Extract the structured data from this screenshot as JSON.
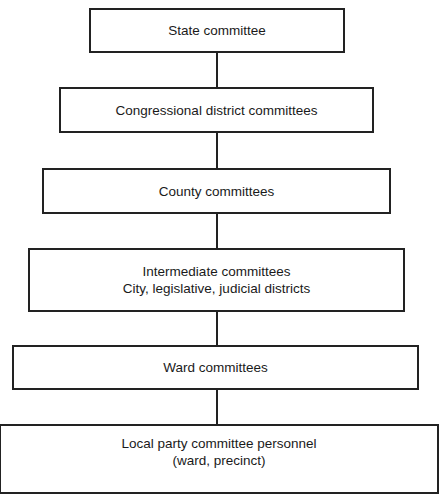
{
  "diagram": {
    "type": "hierarchy",
    "nodes": [
      {
        "id": "state",
        "lines": [
          "State committee"
        ]
      },
      {
        "id": "congressional",
        "lines": [
          "Congressional district committees"
        ]
      },
      {
        "id": "county",
        "lines": [
          "County committees"
        ]
      },
      {
        "id": "intermediate",
        "lines": [
          "Intermediate committees",
          "City, legislative, judicial districts"
        ]
      },
      {
        "id": "ward",
        "lines": [
          "Ward committees"
        ]
      },
      {
        "id": "local",
        "lines": [
          "Local party committee personnel",
          "(ward, precinct)"
        ]
      }
    ],
    "edges": [
      [
        "state",
        "congressional"
      ],
      [
        "congressional",
        "county"
      ],
      [
        "county",
        "intermediate"
      ],
      [
        "intermediate",
        "ward"
      ],
      [
        "ward",
        "local"
      ]
    ]
  }
}
